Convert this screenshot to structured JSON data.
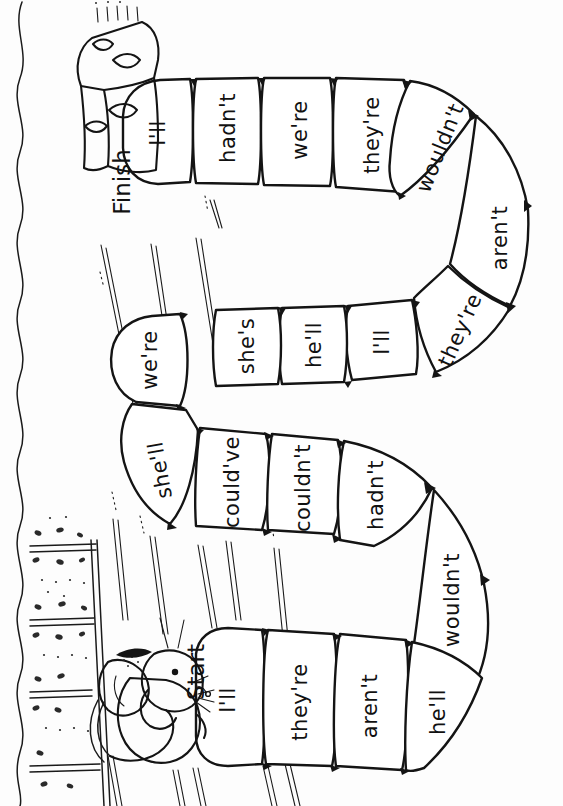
{
  "page": {
    "orientation": "landscape-content-on-portrait-page",
    "background_color": "#ffffff",
    "ink_color": "#111111",
    "has_left_wavy_border": true
  },
  "markers": {
    "start_label": "Start",
    "finish_label": "Finish"
  },
  "icons": {
    "mouse": "mouse-icon",
    "cheese": "cheese-wedge-icon",
    "grass": "grass-blade-icon",
    "ground": "gravel-ground-icon",
    "wavy_border": "wavy-border-icon"
  },
  "board": {
    "space_count": 19,
    "path_description": "serpentine four-row track; Start at bottom-left next to mouse, Finish at top-left at the cheese wedge",
    "spaces": [
      {
        "index": 1,
        "label": "he'll",
        "row": 4,
        "cx": 228,
        "cy": 712,
        "rot": -90
      },
      {
        "index": 2,
        "label": "aren't",
        "row": 4,
        "cx": 300,
        "cy": 712,
        "rot": -90
      },
      {
        "index": 3,
        "label": "they're",
        "row": 4,
        "cx": 372,
        "cy": 716,
        "rot": -90
      },
      {
        "index": 4,
        "label": "I'll",
        "row": 4,
        "cx": 450,
        "cy": 716,
        "rot": -90
      },
      {
        "index": 5,
        "label": "wouldn't",
        "row": 4,
        "cx": 512,
        "cy": 636,
        "rot": -90
      },
      {
        "index": 6,
        "label": "hadn't",
        "row": 3,
        "cx": 375,
        "cy": 500,
        "rot": -90
      },
      {
        "index": 7,
        "label": "couldn't",
        "row": 3,
        "cx": 307,
        "cy": 497,
        "rot": -90
      },
      {
        "index": 8,
        "label": "could've",
        "row": 3,
        "cx": 238,
        "cy": 500,
        "rot": -90
      },
      {
        "index": 9,
        "label": "she'll",
        "row": 3,
        "cx": 164,
        "cy": 480,
        "rot": -90
      },
      {
        "index": 10,
        "label": "we're",
        "row": 2,
        "cx": 143,
        "cy": 367,
        "rot": -90
      },
      {
        "index": 11,
        "label": "she's",
        "row": 2,
        "cx": 228,
        "cy": 360,
        "rot": -90
      },
      {
        "index": 12,
        "label": "he'll",
        "row": 2,
        "cx": 305,
        "cy": 358,
        "rot": -90
      },
      {
        "index": 13,
        "label": "I'll",
        "row": 2,
        "cx": 382,
        "cy": 362,
        "rot": -90
      },
      {
        "index": 14,
        "label": "they're",
        "row": 2,
        "cx": 462,
        "cy": 335,
        "rot": -68
      },
      {
        "index": 15,
        "label": "aren't",
        "row": 1,
        "cx": 512,
        "cy": 245,
        "rot": -90
      },
      {
        "index": 16,
        "label": "wouldn't",
        "row": 1,
        "cx": 440,
        "cy": 148,
        "rot": -70
      },
      {
        "index": 17,
        "label": "they're",
        "row": 1,
        "cx": 372,
        "cy": 135,
        "rot": -90
      },
      {
        "index": 18,
        "label": "we're",
        "row": 1,
        "cx": 300,
        "cy": 130,
        "rot": -90
      },
      {
        "index": 19,
        "label": "hadn't",
        "row": 1,
        "cx": 228,
        "cy": 128,
        "rot": -90
      },
      {
        "index": 20,
        "label": "I'll",
        "row": 1,
        "cx": 158,
        "cy": 133,
        "rot": -90
      }
    ]
  }
}
